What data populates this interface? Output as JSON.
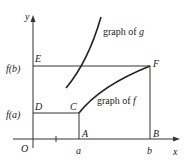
{
  "diagram": {
    "axes": {
      "x_label": "x",
      "y_label": "y",
      "origin_label": "O"
    },
    "points": {
      "A": "A",
      "B": "B",
      "C": "C",
      "D": "D",
      "E": "E",
      "F": "F"
    },
    "ticks": {
      "a": "a",
      "b": "b",
      "fa": "f(a)",
      "fb": "f(b)"
    },
    "curves": {
      "g": "graph of g",
      "f": "graph of f"
    },
    "colors": {
      "line": "#333333",
      "background": "#ffffff"
    }
  }
}
